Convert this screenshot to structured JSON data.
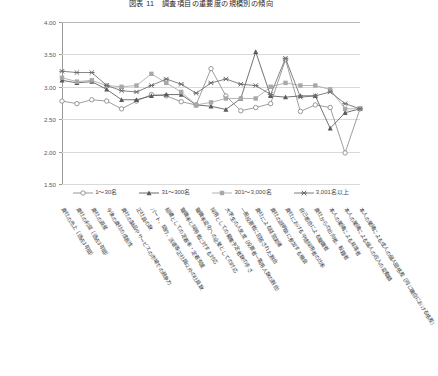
{
  "chart_data": {
    "type": "line",
    "title": "図表 11　調査項目の重要度の規模別の傾向",
    "xlabel": "",
    "ylabel": "",
    "ylim": [
      1.5,
      4.0
    ],
    "yticks": [
      4.0,
      3.5,
      3.0,
      2.5,
      2.0,
      1.5
    ],
    "ytick_labels": [
      "4.00",
      "3.50",
      "3.00",
      "2.50",
      "2.00",
      "1.50"
    ],
    "grid": true,
    "legend_position": "below",
    "categories": [
      "貴社の売上（過去3年間）",
      "貴社の利益（過去3年間）",
      "貴社の資産",
      "今後の貴社の成長性",
      "貴社の製品やサービスの市場での競争力",
      "正社員の数",
      "パート、契約、派遣等正社員以外の社員数",
      "組織としての定着率・定着支援",
      "離職率と採用者に対する対応",
      "離職率変化への企業としての対応",
      "採用としての募集予定者数の手さ",
      "大学生の人気度（投票者一覧用人数の割合）",
      "一般投票者に回答された割合",
      "貴社による経営実績",
      "貴社の説明会に参加する機会",
      "貴社における中途採用者の比率",
      "自己都合による離職者",
      "貴社からの出向者、転籍者",
      "本人の業績による昇進者",
      "本人の業績による個人の収入の変動額",
      "本人の業績による成人の個人間格差（同じ職位における格差）"
    ],
    "series": [
      {
        "name": "1～30名",
        "marker": "circle",
        "color": "#8c8c8c",
        "values": [
          2.78,
          2.74,
          2.8,
          2.78,
          2.66,
          2.78,
          2.88,
          2.86,
          2.77,
          2.72,
          3.28,
          2.86,
          2.63,
          2.68,
          2.74,
          3.42,
          2.62,
          2.72,
          2.68,
          1.98,
          2.66
        ]
      },
      {
        "name": "31～300名",
        "marker": "triangle",
        "color": "#5a5a5a",
        "values": [
          3.1,
          3.06,
          3.08,
          2.96,
          2.8,
          2.8,
          2.86,
          2.88,
          2.88,
          2.72,
          2.7,
          2.65,
          2.82,
          3.54,
          2.86,
          2.84,
          2.86,
          2.86,
          2.36,
          2.6,
          2.66
        ]
      },
      {
        "name": "301～3,000名",
        "marker": "square",
        "color": "#a8a8a8",
        "values": [
          3.14,
          3.08,
          3.1,
          3.02,
          3.0,
          3.02,
          3.2,
          3.06,
          2.92,
          2.72,
          2.76,
          2.82,
          2.82,
          2.82,
          3.0,
          3.06,
          3.02,
          3.02,
          2.96,
          2.66,
          2.66
        ]
      },
      {
        "name": "3,001名以上",
        "marker": "x",
        "color": "#6e6e6e",
        "values": [
          3.24,
          3.22,
          3.22,
          3.02,
          2.94,
          2.92,
          3.02,
          3.12,
          3.04,
          2.9,
          3.06,
          3.12,
          3.04,
          3.02,
          2.88,
          3.44,
          2.84,
          2.86,
          2.92,
          2.74,
          2.66
        ]
      }
    ]
  }
}
